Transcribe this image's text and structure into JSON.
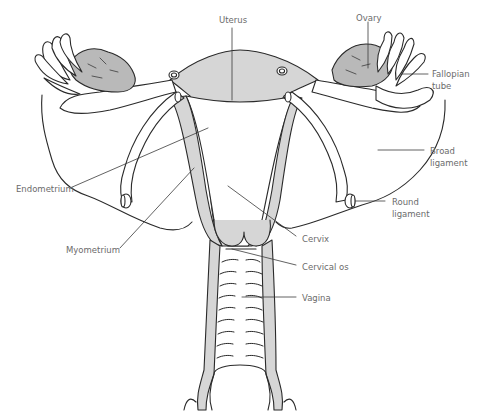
{
  "diagram": {
    "colors": {
      "outline": "#2a2a2a",
      "fill_gray": "#d6d6d6",
      "ovary_gray": "#b9b9b9",
      "label": "#6b6b6b",
      "leader": "#3a3a3a"
    },
    "labels": {
      "uterus": "Uterus",
      "ovary": "Ovary",
      "fallopian_line1": "Fallopian",
      "fallopian_line2": "tube",
      "broad_line1": "Broad",
      "broad_line2": "ligament",
      "round_line1": "Round",
      "round_line2": "ligament",
      "endometrium": "Endometrium",
      "myometrium": "Myometrium",
      "cervix": "Cervix",
      "cervical_os": "Cervical os",
      "vagina": "Vagina"
    }
  }
}
